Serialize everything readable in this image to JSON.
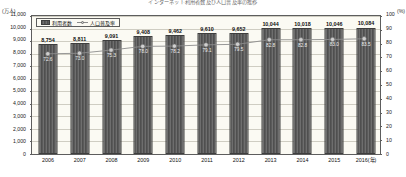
{
  "chart_data": {
    "type": "bar",
    "title": "インターネット利用者数及び人口普及率の推移",
    "categories": [
      "2006",
      "2007",
      "2008",
      "2009",
      "2010",
      "2011",
      "2012",
      "2013",
      "2014",
      "2015",
      "2016"
    ],
    "x_axis_unit_label": "(年)",
    "x_last_tick_label": "2016(年)",
    "series": [
      {
        "name": "利用者数",
        "kind": "bar",
        "axis": "left",
        "unit": "万人",
        "values": [
          8754,
          8811,
          9091,
          9408,
          9462,
          9610,
          9652,
          10044,
          10018,
          10046,
          10084
        ],
        "value_labels": [
          "8,754",
          "8,811",
          "9,091",
          "9,408",
          "9,462",
          "9,610",
          "9,652",
          "10,044",
          "10,018",
          "10,046",
          "10,084"
        ]
      },
      {
        "name": "人口普及率",
        "kind": "line",
        "axis": "right",
        "unit": "%",
        "values": [
          72.6,
          73.0,
          75.3,
          78.0,
          78.2,
          79.1,
          79.5,
          82.8,
          82.8,
          83.0,
          83.5
        ],
        "value_labels": [
          "72.6",
          "73.0",
          "75.3",
          "78.0",
          "78.2",
          "79.1",
          "79.5",
          "82.8",
          "82.8",
          "83.0",
          "83.5"
        ]
      }
    ],
    "ylabel": "(万人)",
    "ylabel_right": "(%)",
    "ylim": [
      0,
      11000
    ],
    "ylim_right": [
      0,
      100
    ],
    "yticks": [
      0,
      1000,
      2000,
      3000,
      4000,
      5000,
      6000,
      7000,
      8000,
      9000,
      10000,
      11000
    ],
    "ytick_labels": [
      "0",
      "1,000",
      "2,000",
      "3,000",
      "4,000",
      "5,000",
      "6,000",
      "7,000",
      "8,000",
      "9,000",
      "10,000",
      "11,000"
    ],
    "yticks_right": [
      0,
      10,
      20,
      30,
      40,
      50,
      60,
      70,
      80,
      90,
      100
    ],
    "ytick_labels_right": [
      "0",
      "10",
      "20",
      "30",
      "40",
      "50",
      "60",
      "70",
      "80",
      "90",
      "100"
    ],
    "grid": true,
    "legend_position": "top-left"
  },
  "legend": {
    "items": [
      {
        "label": "利用者数",
        "marker": "bar-swatch"
      },
      {
        "label": "人口普及率",
        "marker": "line-marker"
      }
    ]
  },
  "colors": {
    "bar_fill": "#5a5a5a",
    "bar_edge": "#3e3e3e",
    "line": "#8c8c8c",
    "marker_fill": "#cfcfcf",
    "plot_background": "#fbfaf3",
    "grid": "#cfcdc2",
    "frame": "#5d5d5d"
  }
}
